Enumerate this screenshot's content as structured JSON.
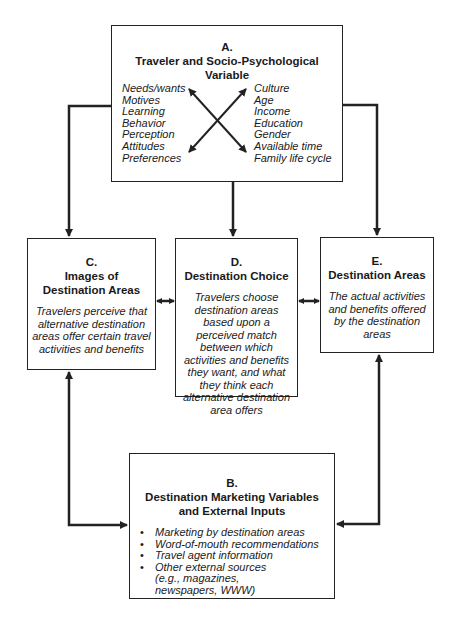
{
  "diagram": {
    "box_a": {
      "letter": "A.",
      "title": "Traveler and Socio-Psychological Variable",
      "left_items": [
        "Needs/wants",
        "Motives",
        "Learning",
        "Behavior",
        "Perception",
        "Attitudes",
        "Preferences"
      ],
      "right_items": [
        "Culture",
        "Age",
        "Income",
        "Education",
        "Gender",
        "Available time",
        "Family life cycle"
      ]
    },
    "box_b": {
      "letter": "B.",
      "title": "Destination Marketing Variables and External Inputs",
      "items": [
        "Marketing by destination areas",
        "Word-of-mouth recommendations",
        "Travel agent information",
        "Other external sources (e.g., magazines, newspapers, WWW)"
      ]
    },
    "box_c": {
      "letter": "C.",
      "title": "Images of Destination Areas",
      "description": "Travelers perceive that alternative destination areas offer certain travel activities and benefits"
    },
    "box_d": {
      "letter": "D.",
      "title": "Destination Choice",
      "description": "Travelers choose destination areas based upon a perceived match between which activities and benefits they want, and what they think each alternative destination area offers"
    },
    "box_e": {
      "letter": "E.",
      "title": "Destination Areas",
      "description": "The actual activities and benefits offered by the destination areas"
    },
    "connections": [
      {
        "from": "A",
        "to": "C",
        "type": "one-way"
      },
      {
        "from": "A",
        "to": "D",
        "type": "one-way"
      },
      {
        "from": "A",
        "to": "E",
        "type": "one-way"
      },
      {
        "from": "C",
        "to": "D",
        "type": "two-way"
      },
      {
        "from": "D",
        "to": "E",
        "type": "two-way"
      },
      {
        "from": "B",
        "to": "C",
        "type": "two-way"
      },
      {
        "from": "B",
        "to": "E",
        "type": "two-way"
      }
    ],
    "colors": {
      "line": "#222222",
      "background": "#ffffff",
      "text": "#1a1a1a"
    }
  }
}
